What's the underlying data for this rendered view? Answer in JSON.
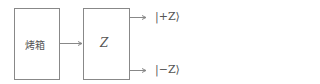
{
  "diagram": {
    "oven_label": "烤箱",
    "analyzer_label": "Z",
    "output_plus": "|+Z⟩",
    "output_minus": "|−Z⟩"
  }
}
